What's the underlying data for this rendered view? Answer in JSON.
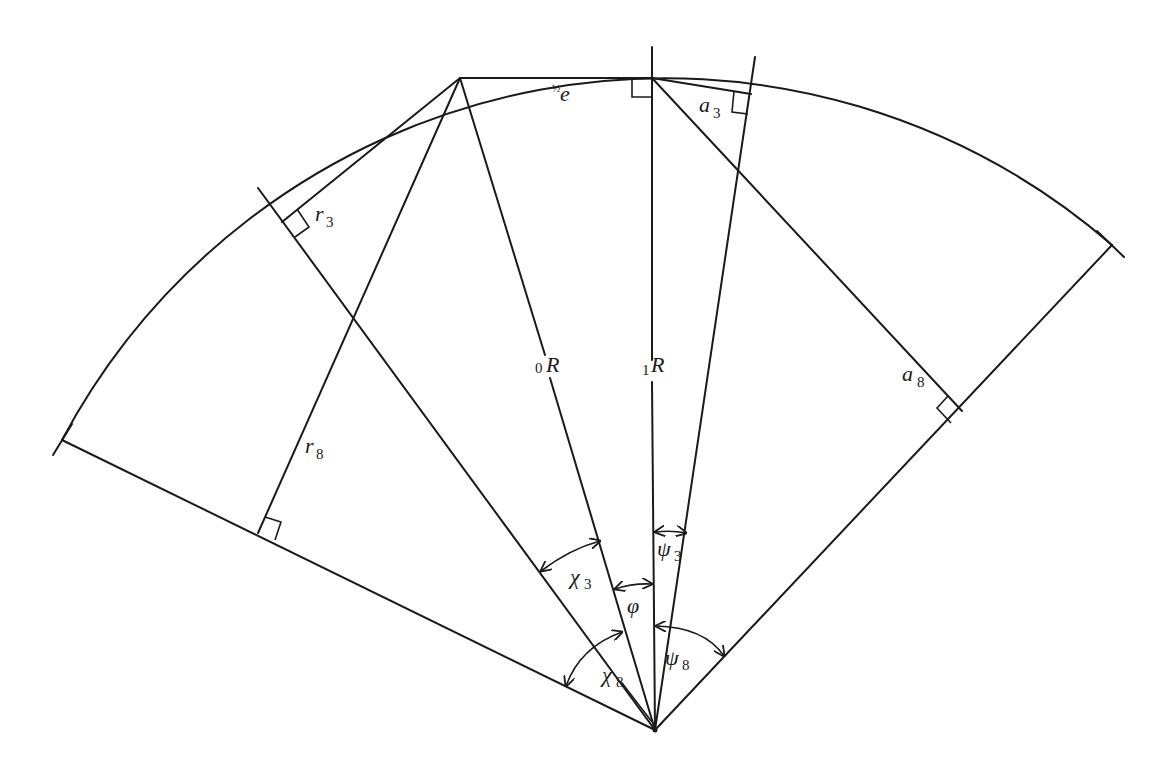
{
  "figure": {
    "labels": {
      "half_e": {
        "frac": "½",
        "var": "e"
      },
      "a3": {
        "var": "a",
        "sub": "3"
      },
      "r3": {
        "var": "r",
        "sub": "3"
      },
      "R0": {
        "pre": "0",
        "var": "R"
      },
      "R1": {
        "pre": "1",
        "var": "R"
      },
      "a8": {
        "var": "a",
        "sub": "8"
      },
      "r8": {
        "var": "r",
        "sub": "8"
      },
      "psi3": {
        "var": "ψ",
        "sub": "3"
      },
      "chi3": {
        "var": "χ",
        "sub": "3"
      },
      "phi": {
        "var": "φ"
      },
      "chi8": {
        "var": "χ",
        "sub": "8"
      },
      "psi8": {
        "var": "ψ",
        "sub": "8"
      }
    },
    "colors": {
      "stroke": "#1a1a1a",
      "background": "#ffffff"
    }
  }
}
